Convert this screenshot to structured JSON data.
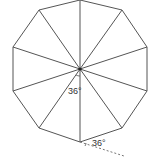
{
  "diagram": {
    "shape": "regular decagon",
    "center": [
      80,
      69
    ],
    "vertices": [
      [
        80,
        0
      ],
      [
        122,
        10
      ],
      [
        147,
        47
      ],
      [
        147,
        91
      ],
      [
        122,
        128
      ],
      [
        80,
        142
      ],
      [
        39,
        128
      ],
      [
        13,
        91
      ],
      [
        13,
        47
      ],
      [
        39,
        10
      ]
    ],
    "labels": {
      "center_angle": "36°",
      "exterior_angle": "36°"
    },
    "colors": {
      "stroke": "#555555",
      "dashed": "#777777",
      "text": "#333333"
    }
  }
}
